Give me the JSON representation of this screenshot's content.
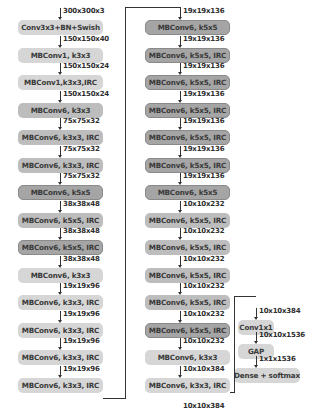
{
  "diagram": {
    "column_left": [
      {
        "label": "Conv3x3+BN+Swish",
        "input": "300x300x3",
        "shade": "light"
      },
      {
        "label": "MBConv1, k3x3",
        "input": "150x150x40",
        "shade": "light"
      },
      {
        "label": "MBConv1,k3x3,IRC",
        "input": "150x150x24",
        "shade": "light"
      },
      {
        "label": "MBConv6, k3x3",
        "input": "150x150x24",
        "shade": "mid"
      },
      {
        "label": "MBConv6, k3x3, IRC",
        "input": "75x75x32",
        "shade": "mid"
      },
      {
        "label": "MBConv6, k3x3, IRC",
        "input": "75x75x32",
        "shade": "mid"
      },
      {
        "label": "MBConv6, k5x5",
        "input": "75x75x32",
        "shade": "dark"
      },
      {
        "label": "MBConv6, k5x5, IRC",
        "input": "38x38x48",
        "shade": "mid"
      },
      {
        "label": "MBConv6, k5x5, IRC",
        "input": "38x38x48",
        "shade": "dark"
      },
      {
        "label": "MBConv6, k3x3",
        "input": "38x38x48",
        "shade": "light"
      },
      {
        "label": "MBConv6, k3x3, IRC",
        "input": "19x19x96",
        "shade": "light"
      },
      {
        "label": "MBConv6, k3x3, IRC",
        "input": "19x19x96",
        "shade": "light"
      },
      {
        "label": "MBConv6, k3x3, IRC",
        "input": "19x19x96",
        "shade": "light"
      },
      {
        "label": "MBConv6, k3x3, IRC",
        "input": "19x19x96",
        "shade": "light"
      }
    ],
    "column_middle": [
      {
        "label": "MBConv6, k5x5",
        "input": "19x19x136",
        "shade": "dark"
      },
      {
        "label": "MBConv6, k5x5, IRC",
        "input": "19x19x136",
        "shade": "dark"
      },
      {
        "label": "MBConv6, k5x5, IRC",
        "input": "19x19x136",
        "shade": "dark"
      },
      {
        "label": "MBConv6, k5x5, IRC",
        "input": "19x19x136",
        "shade": "dark"
      },
      {
        "label": "MBConv6, k5x5, IRC",
        "input": "19x19x136",
        "shade": "dark"
      },
      {
        "label": "MBConv6, k5x5, IRC",
        "input": "19x19x136",
        "shade": "dark"
      },
      {
        "label": "MBConv6, k5x5",
        "input": "19x19x136",
        "shade": "dark"
      },
      {
        "label": "MBConv6, k5x5, IRC",
        "input": "10x10x232",
        "shade": "mid"
      },
      {
        "label": "MBConv6, k5x5, IRC",
        "input": "10x10x232",
        "shade": "mid"
      },
      {
        "label": "MBConv6, k5x5, IRC",
        "input": "10x10x232",
        "shade": "mid"
      },
      {
        "label": "MBConv6, k5x5, IRC",
        "input": "10x10x232",
        "shade": "mid"
      },
      {
        "label": "MBConv6, k5x5, IRC",
        "input": "10x10x232",
        "shade": "dark"
      },
      {
        "label": "MBConv6, k3x3",
        "input": "10x10x232",
        "shade": "light"
      },
      {
        "label": "MBConv6, k3x3, IRC",
        "input": "10x10x384",
        "shade": "light"
      }
    ],
    "column_middle_output": "10x10x384",
    "column_right": [
      {
        "label": "Conv1x1",
        "input": "10x10x384",
        "shade": "light"
      },
      {
        "label": "GAP",
        "input": "10x10x1536",
        "shade": "light"
      },
      {
        "label": "Dense + softmax",
        "input": "1x1x1536",
        "shade": "light"
      }
    ]
  }
}
